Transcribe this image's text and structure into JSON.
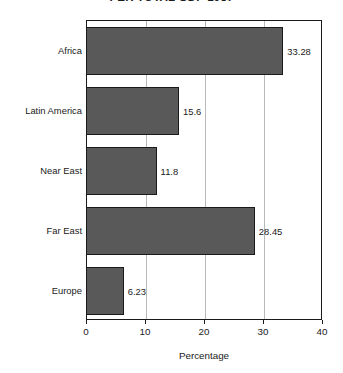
{
  "chart_data": {
    "type": "bar",
    "orientation": "horizontal",
    "title": "PER TOTAL GDP 1987",
    "xlabel": "Percentage",
    "ylabel": "",
    "categories": [
      "Africa",
      "Latin America",
      "Near East",
      "Far East",
      "Europe"
    ],
    "values": [
      33.28,
      15.6,
      11.8,
      28.45,
      6.23
    ],
    "value_labels": [
      "33.28",
      "15.6",
      "11.8",
      "28.45",
      "6.23"
    ],
    "xlim": [
      0,
      40
    ],
    "xticks": [
      0,
      10,
      20,
      30,
      40
    ],
    "xtick_labels": [
      "0",
      "10",
      "20",
      "30",
      "40"
    ],
    "grid": true,
    "grid_axis": "x",
    "legend": false,
    "bar_color": "#595959",
    "bar_edge_color": "#1a1a1a",
    "grid_color": "#b9b9b9",
    "axis_color": "#1a1a1a",
    "background": "#ffffff"
  }
}
